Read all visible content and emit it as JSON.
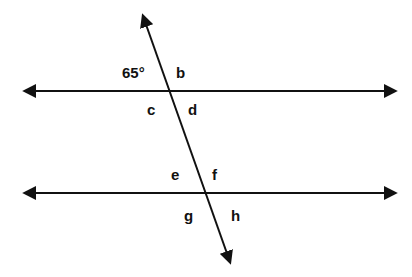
{
  "diagram": {
    "type": "parallel-lines-cut-by-transversal",
    "lines": [
      {
        "id": "line-top",
        "y": 91,
        "x1": 25,
        "x2": 395
      },
      {
        "id": "line-bottom",
        "y": 193,
        "x1": 25,
        "x2": 395
      },
      {
        "id": "transversal",
        "x1": 143,
        "y1": 16,
        "x2": 230,
        "y2": 262
      }
    ],
    "labels": {
      "given_angle": "65°",
      "b": "b",
      "c": "c",
      "d": "d",
      "e": "e",
      "f": "f",
      "g": "g",
      "h": "h"
    },
    "colors": {
      "stroke": "#111111",
      "background": "#ffffff"
    }
  }
}
